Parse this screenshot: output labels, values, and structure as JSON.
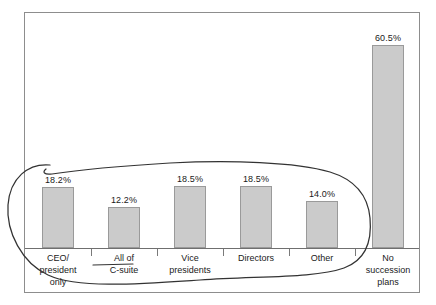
{
  "chart_data": {
    "type": "bar",
    "title": "",
    "subtitle": "",
    "xlabel": "",
    "ylabel": "",
    "ylim": [
      0,
      70
    ],
    "grid": false,
    "legend": "none",
    "categories": [
      "CEO/\npresident\nonly",
      "All of\nC-suite",
      "Vice\npresidents",
      "Directors",
      "Other",
      "No\nsuccession\nplans"
    ],
    "values": [
      18.2,
      12.2,
      18.5,
      18.5,
      14.0,
      60.5
    ],
    "value_labels": [
      "18.2%",
      "12.2%",
      "18.5%",
      "18.5%",
      "14.0%",
      "60.5%"
    ],
    "annotations": [
      {
        "kind": "hand-drawn-oval",
        "encircles": [
          "CEO/president only",
          "All of C-suite",
          "Vice presidents",
          "Directors",
          "Other"
        ],
        "strikethrough_label": "C-suite"
      }
    ]
  },
  "colors": {
    "bar_fill": "#CBCBCB",
    "bar_stroke": "#9A9A9A",
    "frame": "#8D8D8D",
    "axis": "#6F6F6F",
    "text": "#1A1A1A",
    "annotation": "#333333"
  }
}
